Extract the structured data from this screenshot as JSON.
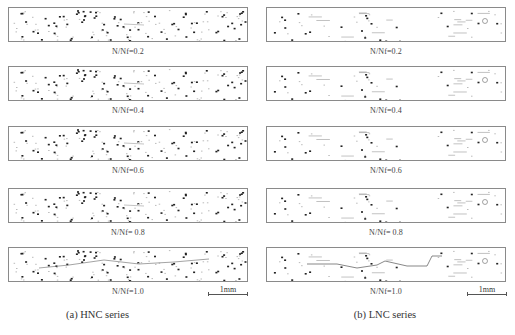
{
  "figure": {
    "columns": [
      {
        "id": "hnc",
        "caption": "(a) HNC series",
        "panels": [
          {
            "label": "N/Nf=0.2"
          },
          {
            "label": "N/Nf=0.4"
          },
          {
            "label": "N/Nf=0.6"
          },
          {
            "label": "N/Nf= 0.8"
          },
          {
            "label": "N/Nf=1.0"
          }
        ],
        "scale_bar": "1mm"
      },
      {
        "id": "lnc",
        "caption": "(b) LNC series",
        "panels": [
          {
            "label": "N/Nf=0.2"
          },
          {
            "label": "N/Nf=0.4"
          },
          {
            "label": "N/Nf=0.6"
          },
          {
            "label": "N/Nf= 0.8"
          },
          {
            "label": "N/Nf=1.0"
          }
        ],
        "scale_bar": "1mm"
      }
    ]
  }
}
